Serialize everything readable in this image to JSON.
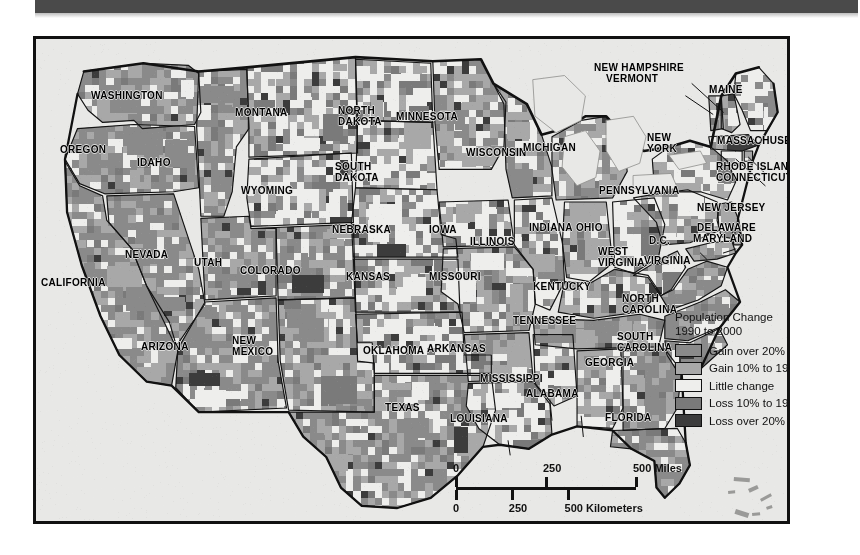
{
  "page": {
    "background_color": "#ffffff",
    "top_band_color": "#4a4a4a"
  },
  "map": {
    "frame_color": "#111111",
    "ocean_color": "#e8e8e6",
    "title_present": false,
    "state_labels": [
      {
        "text": "WASHINGTON",
        "x": 55,
        "y": 51,
        "align": "left"
      },
      {
        "text": "OREGON",
        "x": 24,
        "y": 105,
        "align": "left"
      },
      {
        "text": "IDAHO",
        "x": 101,
        "y": 118,
        "align": "left"
      },
      {
        "text": "MONTANA",
        "x": 199,
        "y": 68,
        "align": "left"
      },
      {
        "text": "WYOMING",
        "x": 205,
        "y": 146,
        "align": "left"
      },
      {
        "text": "NEVADA",
        "x": 89,
        "y": 210,
        "align": "left"
      },
      {
        "text": "UTAH",
        "x": 158,
        "y": 218,
        "align": "left"
      },
      {
        "text": "CALIFORNIA",
        "x": 5,
        "y": 238,
        "align": "left"
      },
      {
        "text": "ARIZONA",
        "x": 105,
        "y": 302,
        "align": "left"
      },
      {
        "text": "NEW\nMEXICO",
        "x": 196,
        "y": 296,
        "align": "left"
      },
      {
        "text": "COLORADO",
        "x": 204,
        "y": 226,
        "align": "left"
      },
      {
        "text": "NORTH\nDAKOTA",
        "x": 302,
        "y": 66,
        "align": "left"
      },
      {
        "text": "SOUTH\nDAKOTA",
        "x": 299,
        "y": 122,
        "align": "left"
      },
      {
        "text": "NEBRASKA",
        "x": 296,
        "y": 185,
        "align": "left"
      },
      {
        "text": "KANSAS",
        "x": 310,
        "y": 232,
        "align": "left"
      },
      {
        "text": "OKLAHOMA",
        "x": 327,
        "y": 306,
        "align": "left"
      },
      {
        "text": "TEXAS",
        "x": 349,
        "y": 363,
        "align": "left"
      },
      {
        "text": "MINNESOTA",
        "x": 360,
        "y": 72,
        "align": "left"
      },
      {
        "text": "IOWA",
        "x": 393,
        "y": 185,
        "align": "left"
      },
      {
        "text": "MISSOURI",
        "x": 393,
        "y": 232,
        "align": "left"
      },
      {
        "text": "ARKANSAS",
        "x": 391,
        "y": 304,
        "align": "left"
      },
      {
        "text": "LOUISIANA",
        "x": 414,
        "y": 374,
        "align": "left"
      },
      {
        "text": "WISCONSIN",
        "x": 430,
        "y": 108,
        "align": "left"
      },
      {
        "text": "ILLINSOIS_PLACEHOLDER",
        "x": 0,
        "y": 0,
        "align": "left",
        "hidden": true
      },
      {
        "text": "ILLINOIS",
        "x": 434,
        "y": 197,
        "align": "left"
      },
      {
        "text": "MISSISSIPPI",
        "x": 444,
        "y": 334,
        "align": "left"
      },
      {
        "text": "MICHIGAN",
        "x": 487,
        "y": 103,
        "align": "left"
      },
      {
        "text": "INDIANA",
        "x": 493,
        "y": 183,
        "align": "left"
      },
      {
        "text": "OHIO",
        "x": 540,
        "y": 183,
        "align": "left"
      },
      {
        "text": "KENTUCKY",
        "x": 497,
        "y": 242,
        "align": "left"
      },
      {
        "text": "TENNESSEE",
        "x": 477,
        "y": 276,
        "align": "left"
      },
      {
        "text": "ALABAMA",
        "x": 490,
        "y": 349,
        "align": "left"
      },
      {
        "text": "GEORGIA",
        "x": 549,
        "y": 318,
        "align": "left"
      },
      {
        "text": "FLORIDA",
        "x": 569,
        "y": 373,
        "align": "left"
      },
      {
        "text": "WEST\nVIRGINIA",
        "x": 562,
        "y": 207,
        "align": "left"
      },
      {
        "text": "VIRGINIA",
        "x": 608,
        "y": 216,
        "align": "left"
      },
      {
        "text": "D.C.",
        "x": 613,
        "y": 196,
        "align": "left"
      },
      {
        "text": "NORTH\nCAROLINA",
        "x": 586,
        "y": 254,
        "align": "left"
      },
      {
        "text": "SOUTH\nCAROLINA",
        "x": 581,
        "y": 292,
        "align": "left"
      },
      {
        "text": "PENNSYLVANIA",
        "x": 563,
        "y": 146,
        "align": "left"
      },
      {
        "text": "NEW\nYORK",
        "x": 611,
        "y": 93,
        "align": "left"
      },
      {
        "text": "NEW JERSEY",
        "x": 661,
        "y": 163,
        "align": "left"
      },
      {
        "text": "DELAWARE",
        "x": 661,
        "y": 183,
        "align": "left"
      },
      {
        "text": "MARYLAND",
        "x": 657,
        "y": 194,
        "align": "left"
      },
      {
        "text": "MAINE",
        "x": 673,
        "y": 45,
        "align": "left"
      },
      {
        "text": "NEW HAMPSHIRE",
        "x": 558,
        "y": 23,
        "align": "left"
      },
      {
        "text": "VERMONT",
        "x": 570,
        "y": 34,
        "align": "left"
      },
      {
        "text": "MASSACHUSETTS",
        "x": 681,
        "y": 96,
        "align": "left"
      },
      {
        "text": "RHODE ISLAND",
        "x": 680,
        "y": 122,
        "align": "left"
      },
      {
        "text": "CONNECTICUT",
        "x": 680,
        "y": 133,
        "align": "left"
      }
    ]
  },
  "legend": {
    "title": "Population Change\n1990 to 2000",
    "items": [
      {
        "label": "Gain over 20%",
        "color": "#8a8a8a"
      },
      {
        "label": "Gain 10% to 19%",
        "color": "#a8a8a8"
      },
      {
        "label": "Little change",
        "color": "#eeeeec"
      },
      {
        "label": "Loss 10% to 19%",
        "color": "#7a7a7a"
      },
      {
        "label": "Loss over 20%",
        "color": "#3c3c3c"
      }
    ]
  },
  "scale_bar": {
    "miles": {
      "labels": [
        "0",
        "250",
        "500 Miles"
      ],
      "positions": [
        0,
        50,
        100
      ]
    },
    "kilometers": {
      "labels": [
        "0",
        "250",
        "500 Kilometers"
      ],
      "positions": [
        0,
        31,
        62
      ]
    }
  },
  "chart_data": {
    "type": "choropleth-map",
    "title": "Population Change 1990 to 2000",
    "region": "United States (contiguous), by county",
    "classes": [
      {
        "label": "Gain over 20%",
        "color": "#8a8a8a"
      },
      {
        "label": "Gain 10% to 19%",
        "color": "#a8a8a8"
      },
      {
        "label": "Little change",
        "color": "#eeeeec"
      },
      {
        "label": "Loss 10% to 19%",
        "color": "#7a7a7a"
      },
      {
        "label": "Loss over 20%",
        "color": "#3c3c3c"
      }
    ],
    "ocean_color": "#e8e8e6",
    "land_base_color": "#cfcfcd",
    "scale_miles": [
      0,
      250,
      500
    ],
    "scale_kilometers": [
      0,
      250,
      500
    ],
    "legend_position": "right-center",
    "state_dominant_class": [
      {
        "state": "WASHINGTON",
        "class": "Gain over 20%"
      },
      {
        "state": "OREGON",
        "class": "Gain over 20%"
      },
      {
        "state": "IDAHO",
        "class": "Gain over 20%"
      },
      {
        "state": "MONTANA",
        "class": "Little change"
      },
      {
        "state": "WYOMING",
        "class": "Little change"
      },
      {
        "state": "NEVADA",
        "class": "Gain over 20%"
      },
      {
        "state": "UTAH",
        "class": "Gain over 20%"
      },
      {
        "state": "CALIFORNIA",
        "class": "Gain over 20%"
      },
      {
        "state": "ARIZONA",
        "class": "Gain over 20%"
      },
      {
        "state": "NEW MEXICO",
        "class": "Gain 10% to 19%"
      },
      {
        "state": "COLORADO",
        "class": "Gain over 20%"
      },
      {
        "state": "NORTH DAKOTA",
        "class": "Little change"
      },
      {
        "state": "SOUTH DAKOTA",
        "class": "Little change"
      },
      {
        "state": "NEBRASKA",
        "class": "Little change"
      },
      {
        "state": "KANSAS",
        "class": "Little change"
      },
      {
        "state": "OKLAHOMA",
        "class": "Little change"
      },
      {
        "state": "TEXAS",
        "class": "Gain over 20%"
      },
      {
        "state": "MINNESOTA",
        "class": "Gain 10% to 19%"
      },
      {
        "state": "IOWA",
        "class": "Little change"
      },
      {
        "state": "MISSOURI",
        "class": "Gain 10% to 19%"
      },
      {
        "state": "ARKANSAS",
        "class": "Gain 10% to 19%"
      },
      {
        "state": "LOUISIANA",
        "class": "Little change"
      },
      {
        "state": "WISCONSIN",
        "class": "Gain 10% to 19%"
      },
      {
        "state": "ILLINOIS",
        "class": "Little change"
      },
      {
        "state": "MISSISSIPPI",
        "class": "Little change"
      },
      {
        "state": "MICHIGAN",
        "class": "Gain 10% to 19%"
      },
      {
        "state": "INDIANA",
        "class": "Gain 10% to 19%"
      },
      {
        "state": "OHIO",
        "class": "Little change"
      },
      {
        "state": "KENTUCKY",
        "class": "Gain 10% to 19%"
      },
      {
        "state": "TENNESSEE",
        "class": "Gain over 20%"
      },
      {
        "state": "ALABAMA",
        "class": "Gain 10% to 19%"
      },
      {
        "state": "GEORGIA",
        "class": "Gain over 20%"
      },
      {
        "state": "FLORIDA",
        "class": "Gain over 20%"
      },
      {
        "state": "WEST VIRGINIA",
        "class": "Little change"
      },
      {
        "state": "VIRGINIA",
        "class": "Gain over 20%"
      },
      {
        "state": "NORTH CAROLINA",
        "class": "Gain over 20%"
      },
      {
        "state": "SOUTH CAROLINA",
        "class": "Gain over 20%"
      },
      {
        "state": "PENNSYLVANIA",
        "class": "Little change"
      },
      {
        "state": "NEW YORK",
        "class": "Little change"
      },
      {
        "state": "NEW JERSEY",
        "class": "Gain 10% to 19%"
      },
      {
        "state": "DELAWARE",
        "class": "Gain 10% to 19%"
      },
      {
        "state": "MARYLAND",
        "class": "Gain 10% to 19%"
      },
      {
        "state": "MAINE",
        "class": "Little change"
      },
      {
        "state": "NEW HAMPSHIRE",
        "class": "Gain 10% to 19%"
      },
      {
        "state": "VERMONT",
        "class": "Little change"
      },
      {
        "state": "MASSACHUSETTS",
        "class": "Little change"
      },
      {
        "state": "RHODE ISLAND",
        "class": "Little change"
      },
      {
        "state": "CONNECTICUT",
        "class": "Little change"
      }
    ]
  }
}
